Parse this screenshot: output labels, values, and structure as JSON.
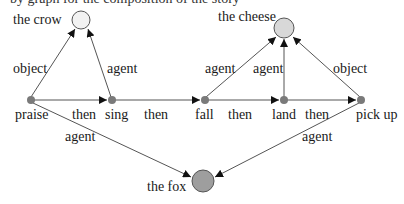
{
  "diagram": {
    "cut_top_text": "by graph for the composition of the story",
    "entities": [
      {
        "id": "crow",
        "label": "the crow",
        "fill": "#f2f2f2"
      },
      {
        "id": "cheese",
        "label": "the cheese",
        "fill": "#d8d8d8"
      },
      {
        "id": "fox",
        "label": "the fox",
        "fill": "#9e9e9e"
      }
    ],
    "events": [
      {
        "id": "praise",
        "label": "praise"
      },
      {
        "id": "sing",
        "label": "sing"
      },
      {
        "id": "fall",
        "label": "fall"
      },
      {
        "id": "land",
        "label": "land"
      },
      {
        "id": "pickup",
        "label": "pick up"
      }
    ],
    "event_node_color": "#7a7a7a",
    "edges": [
      {
        "from": "praise",
        "to": "sing",
        "label": "then"
      },
      {
        "from": "sing",
        "to": "fall",
        "label": "then"
      },
      {
        "from": "fall",
        "to": "land",
        "label": "then"
      },
      {
        "from": "land",
        "to": "pickup",
        "label": "then"
      },
      {
        "from": "praise",
        "to": "crow",
        "label": "object"
      },
      {
        "from": "sing",
        "to": "crow",
        "label": "agent"
      },
      {
        "from": "fall",
        "to": "cheese",
        "label": "agent"
      },
      {
        "from": "land",
        "to": "cheese",
        "label": "agent"
      },
      {
        "from": "pickup",
        "to": "cheese",
        "label": "object"
      },
      {
        "from": "praise",
        "to": "fox",
        "label": "agent"
      },
      {
        "from": "pickup",
        "to": "fox",
        "label": "agent"
      }
    ]
  }
}
